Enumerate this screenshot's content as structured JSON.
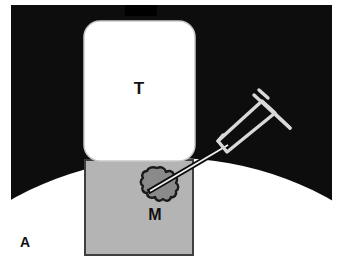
{
  "figure": {
    "panel_label": "A",
    "background_color": "#ffffff",
    "tissue_color": "#0d0d0d",
    "tissue_notch_color": "#000000",
    "organ_fill_color": "#ffffff",
    "muscle_fill_color": "#b4b4b4",
    "muscle_border_color": "#3f3f3f",
    "lesion_fill_color": "#8a8a8a",
    "lesion_outline_color": "#1a1a1a",
    "syringe_color": "#d9d9d9",
    "needle_color": "#0d0d0d",
    "needle_core_color": "#f2f2f2",
    "label_color": "#111111"
  },
  "regions": {
    "tumor": {
      "id": "T",
      "label": "T",
      "name": "tumor-block"
    },
    "muscle": {
      "id": "M",
      "label": "M",
      "name": "muscle-block"
    },
    "lesion": {
      "name": "lesion-blob",
      "label": ""
    }
  },
  "instrument": {
    "name": "syringe",
    "label": "",
    "needle_label": ""
  },
  "panel": {
    "label": "A"
  }
}
